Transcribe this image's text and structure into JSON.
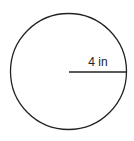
{
  "diagram": {
    "shape": "circle",
    "radius_label": "4 in",
    "stroke_color": "#222222",
    "background": "#ffffff"
  }
}
